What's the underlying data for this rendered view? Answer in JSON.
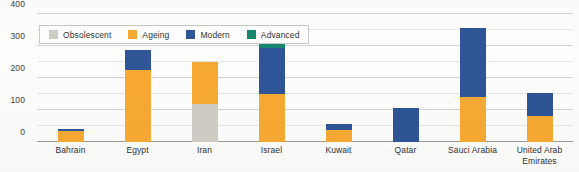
{
  "chart_data": {
    "type": "bar",
    "stacked": true,
    "title": "",
    "xlabel": "",
    "ylabel": "",
    "ylim": [
      0,
      400
    ],
    "yticks": [
      0,
      100,
      200,
      300,
      400
    ],
    "ytick_labels": [
      "0",
      "100",
      "200",
      "300",
      "400"
    ],
    "minor_gridlines": [
      50,
      150,
      250,
      350
    ],
    "grid": true,
    "legend_position": "top-left-inside",
    "categories": [
      "Bahrain",
      "Egypt",
      "Iran",
      "Israel",
      "Kuwait",
      "Qatar",
      "Sauci Arabia",
      "United Arab Emirates"
    ],
    "series": [
      {
        "name": "Obsolescent",
        "color": "#cfcdc4",
        "values": [
          0,
          0,
          118,
          0,
          0,
          0,
          0,
          0
        ]
      },
      {
        "name": "Ageing",
        "color": "#f7a933",
        "values": [
          33,
          225,
          132,
          150,
          36,
          0,
          140,
          80
        ]
      },
      {
        "name": "Modern",
        "color": "#2f5597",
        "values": [
          8,
          63,
          0,
          145,
          19,
          105,
          215,
          72
        ]
      },
      {
        "name": "Advanced",
        "color": "#16866f",
        "values": [
          0,
          0,
          0,
          30,
          0,
          0,
          0,
          0
        ]
      }
    ],
    "totals": [
      41,
      288,
      250,
      325,
      55,
      105,
      355,
      152
    ]
  },
  "legend": {
    "items": [
      {
        "label": "Obsolescent",
        "color": "#cfcdc4"
      },
      {
        "label": "Ageing",
        "color": "#f7a933"
      },
      {
        "label": "Modern",
        "color": "#2f5597"
      },
      {
        "label": "Advanced",
        "color": "#16866f"
      }
    ]
  },
  "axis": {
    "y_tick_labels": [
      "400",
      "300",
      "200",
      "100",
      "0"
    ]
  },
  "colors": {
    "obsolescent": "#cfcdc4",
    "ageing": "#f7a933",
    "modern": "#2f5597",
    "advanced": "#16866f",
    "gridline": "#d2d2cf",
    "minor_gridline": "#e6e6e3",
    "axis_text": "#2f2f2f",
    "background": "#fdfdfc"
  }
}
